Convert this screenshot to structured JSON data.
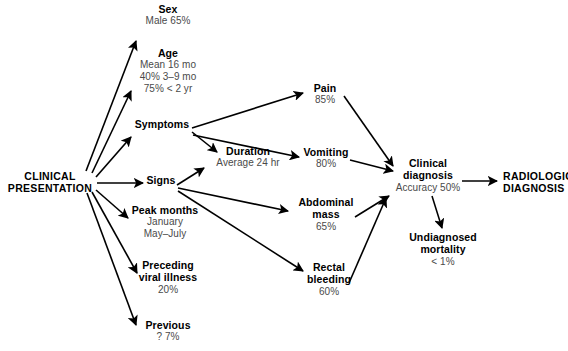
{
  "diagram": {
    "stroke_color": "#000000",
    "label_color": "#000000",
    "sub_color": "#4a4a4a",
    "nodes": [
      {
        "id": "clinical-presentation",
        "label_line1": "CLINICAL",
        "label_line2": "PRESENTATION",
        "sub": []
      },
      {
        "id": "sex",
        "label": "Sex",
        "sub": [
          "Male 65%"
        ]
      },
      {
        "id": "age",
        "label": "Age",
        "sub": [
          "Mean 16 mo",
          "40% 3–9 mo",
          "75% < 2 yr"
        ]
      },
      {
        "id": "symptoms",
        "label": "Symptoms",
        "sub": []
      },
      {
        "id": "signs",
        "label": "Signs",
        "sub": []
      },
      {
        "id": "peak-months",
        "label": "Peak months",
        "sub": [
          "January",
          "May–July"
        ]
      },
      {
        "id": "preceding-viral-illness",
        "label_line1": "Preceding",
        "label_line2": "viral illness",
        "sub": [
          "20%"
        ]
      },
      {
        "id": "previous",
        "label": "Previous",
        "sub": [
          "? 7%"
        ]
      },
      {
        "id": "duration",
        "label": "Duration",
        "sub": [
          "Average 24 hr"
        ]
      },
      {
        "id": "pain",
        "label": "Pain",
        "sub": [
          "85%"
        ]
      },
      {
        "id": "vomiting",
        "label": "Vomiting",
        "sub": [
          "80%"
        ]
      },
      {
        "id": "abdominal-mass",
        "label_line1": "Abdominal",
        "label_line2": "mass",
        "sub": [
          "65%"
        ]
      },
      {
        "id": "rectal-bleeding",
        "label_line1": "Rectal",
        "label_line2": "bleeding",
        "sub": [
          "60%"
        ]
      },
      {
        "id": "clinical-diagnosis",
        "label_line1": "Clinical",
        "label_line2": "diagnosis",
        "sub": [
          "Accuracy 50%"
        ]
      },
      {
        "id": "undiagnosed-mortality",
        "label_line1": "Undiagnosed",
        "label_line2": "mortality",
        "sub": [
          "< 1%"
        ]
      },
      {
        "id": "radiologic-diagnosis",
        "label_line1": "RADIOLOGIC",
        "label_line2": "DIAGNOSIS",
        "sub": []
      }
    ],
    "edges": [
      {
        "from": "clinical-presentation",
        "to": "sex"
      },
      {
        "from": "clinical-presentation",
        "to": "age"
      },
      {
        "from": "clinical-presentation",
        "to": "symptoms"
      },
      {
        "from": "clinical-presentation",
        "to": "signs"
      },
      {
        "from": "clinical-presentation",
        "to": "peak-months"
      },
      {
        "from": "clinical-presentation",
        "to": "preceding-viral-illness"
      },
      {
        "from": "clinical-presentation",
        "to": "previous"
      },
      {
        "from": "symptoms",
        "to": "pain"
      },
      {
        "from": "symptoms",
        "to": "duration"
      },
      {
        "from": "symptoms",
        "to": "vomiting"
      },
      {
        "from": "signs",
        "to": "duration"
      },
      {
        "from": "signs",
        "to": "abdominal-mass"
      },
      {
        "from": "signs",
        "to": "rectal-bleeding"
      },
      {
        "from": "pain",
        "to": "clinical-diagnosis"
      },
      {
        "from": "vomiting",
        "to": "clinical-diagnosis"
      },
      {
        "from": "abdominal-mass",
        "to": "clinical-diagnosis"
      },
      {
        "from": "rectal-bleeding",
        "to": "clinical-diagnosis"
      },
      {
        "from": "clinical-diagnosis",
        "to": "undiagnosed-mortality"
      },
      {
        "from": "clinical-diagnosis",
        "to": "radiologic-diagnosis"
      }
    ]
  },
  "labels": {
    "clinical_presentation_l1": "CLINICAL",
    "clinical_presentation_l2": "PRESENTATION",
    "sex": "Sex",
    "sex_sub": "Male 65%",
    "age": "Age",
    "age_sub1": "Mean 16 mo",
    "age_sub2": "40% 3–9 mo",
    "age_sub3": "75% < 2 yr",
    "symptoms": "Symptoms",
    "signs": "Signs",
    "peak_months": "Peak months",
    "peak_months_sub1": "January",
    "peak_months_sub2": "May–July",
    "preceding_l1": "Preceding",
    "preceding_l2": "viral illness",
    "preceding_sub": "20%",
    "previous": "Previous",
    "previous_sub": "? 7%",
    "duration": "Duration",
    "duration_sub": "Average 24 hr",
    "pain": "Pain",
    "pain_sub": "85%",
    "vomiting": "Vomiting",
    "vomiting_sub": "80%",
    "abdominal_l1": "Abdominal",
    "abdominal_l2": "mass",
    "abdominal_sub": "65%",
    "rectal_l1": "Rectal",
    "rectal_l2": "bleeding",
    "rectal_sub": "60%",
    "clinical_diag_l1": "Clinical",
    "clinical_diag_l2": "diagnosis",
    "clinical_diag_sub": "Accuracy 50%",
    "undiagnosed_l1": "Undiagnosed",
    "undiagnosed_l2": "mortality",
    "undiagnosed_sub": "< 1%",
    "radiologic_l1": "RADIOLOGIC",
    "radiologic_l2": "DIAGNOSIS"
  }
}
